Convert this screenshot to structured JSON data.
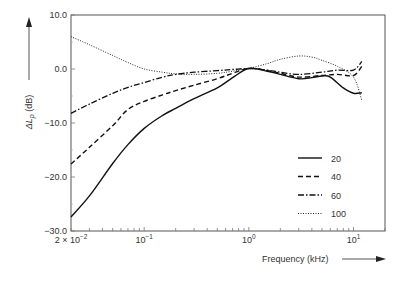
{
  "chart_data": {
    "type": "line",
    "title": "",
    "xlabel": "Frequency (kHz)",
    "ylabel_prefix": "ΔL",
    "ylabel_sub": "p",
    "ylabel_suffix": " (dB)",
    "xscale": "log",
    "xlim": [
      0.02,
      20
    ],
    "ylim": [
      -30,
      10
    ],
    "grid": false,
    "legend_position": "lower-right",
    "yticks": [
      {
        "value": 10,
        "label": "10.0"
      },
      {
        "value": 0,
        "label": "0.0"
      },
      {
        "value": -10,
        "label": "-10.0"
      },
      {
        "value": -20,
        "label": "-20.0"
      },
      {
        "value": -30,
        "label": "-30.0"
      }
    ],
    "xticks": [
      {
        "value": 0.02,
        "label_base": "2 × 10",
        "label_exp": "-2"
      },
      {
        "value": 0.1,
        "label_base": "10",
        "label_exp": "-1"
      },
      {
        "value": 1,
        "label_base": "10",
        "label_exp": "0"
      },
      {
        "value": 10,
        "label_base": "10",
        "label_exp": "1"
      }
    ],
    "series": [
      {
        "name": "20",
        "style": "solid",
        "x": [
          0.02,
          0.03,
          0.05,
          0.07,
          0.1,
          0.15,
          0.2,
          0.3,
          0.5,
          0.7,
          1.0,
          1.5,
          2.0,
          3.0,
          4.0,
          5.0,
          6.0,
          8.0,
          10.0,
          12.0
        ],
        "y": [
          -27.4,
          -23.5,
          -17.5,
          -14.0,
          -11.0,
          -8.6,
          -7.3,
          -5.5,
          -3.5,
          -1.6,
          0.1,
          -0.4,
          -1.0,
          -1.8,
          -1.6,
          -1.3,
          -1.5,
          -3.5,
          -4.5,
          -4.4
        ]
      },
      {
        "name": "40",
        "style": "dashed",
        "x": [
          0.02,
          0.03,
          0.05,
          0.07,
          0.1,
          0.15,
          0.2,
          0.3,
          0.5,
          0.7,
          1.0,
          1.5,
          2.0,
          3.0,
          5.0,
          7.0,
          10.0,
          12.0
        ],
        "y": [
          -17.6,
          -14.5,
          -10.5,
          -7.5,
          -6.0,
          -4.8,
          -4.0,
          -3.0,
          -1.8,
          -0.8,
          0.1,
          -0.3,
          -0.8,
          -1.5,
          -1.2,
          -1.0,
          -1.2,
          0.5
        ]
      },
      {
        "name": "60",
        "style": "dash-dot",
        "x": [
          0.02,
          0.03,
          0.05,
          0.07,
          0.1,
          0.15,
          0.2,
          0.3,
          0.5,
          0.7,
          1.0,
          1.5,
          2.0,
          3.0,
          5.0,
          7.0,
          10.0,
          12.0
        ],
        "y": [
          -8.2,
          -6.5,
          -4.5,
          -3.4,
          -2.5,
          -1.5,
          -1.0,
          -0.6,
          -0.3,
          -0.1,
          0.1,
          -0.2,
          -0.6,
          -1.0,
          -0.6,
          -0.2,
          -0.2,
          1.4
        ]
      },
      {
        "name": "100",
        "style": "dotted",
        "x": [
          0.02,
          0.03,
          0.05,
          0.07,
          0.1,
          0.15,
          0.2,
          0.3,
          0.5,
          0.7,
          1.0,
          1.5,
          2.0,
          3.0,
          4.0,
          5.0,
          7.0,
          10.0,
          12.0
        ],
        "y": [
          6.0,
          4.5,
          2.5,
          1.2,
          0.0,
          -0.6,
          -0.9,
          -1.0,
          -0.8,
          -0.4,
          0.1,
          1.0,
          1.8,
          2.4,
          2.2,
          1.6,
          0.5,
          -1.5,
          -5.8
        ]
      }
    ]
  }
}
